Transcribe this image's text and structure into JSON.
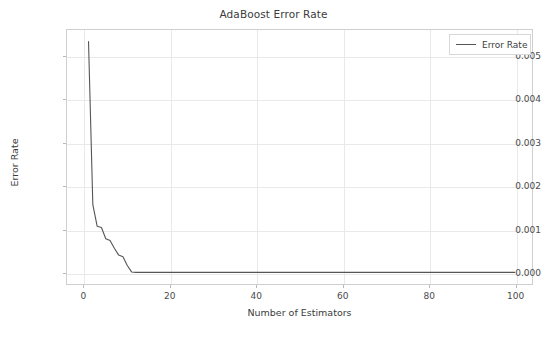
{
  "chart_data": {
    "type": "line",
    "title": "AdaBoost Error Rate",
    "xlabel": "Number of Estimators",
    "ylabel": "Error Rate",
    "xlim": [
      -4.0,
      104.0
    ],
    "ylim": [
      -0.00027,
      0.00562
    ],
    "xticks": [
      0,
      20,
      40,
      60,
      80,
      100
    ],
    "xtick_labels": [
      "0",
      "20",
      "40",
      "60",
      "80",
      "100"
    ],
    "yticks": [
      0.0,
      0.001,
      0.002,
      0.003,
      0.004,
      0.005
    ],
    "ytick_labels": [
      "0.000",
      "0.001",
      "0.002",
      "0.003",
      "0.004",
      "0.005"
    ],
    "grid": true,
    "legend_position": "upper right",
    "line_color": "#555555",
    "grid_color": "#e9e9e9",
    "frame_color": "#cfcfcf",
    "series": [
      {
        "name": "Error Rate",
        "x": [
          1,
          2,
          3,
          4,
          5,
          6,
          7,
          8,
          9,
          10,
          11,
          12,
          13,
          14,
          15,
          16,
          17,
          18,
          19,
          20,
          25,
          30,
          35,
          40,
          45,
          50,
          55,
          60,
          65,
          70,
          75,
          80,
          85,
          90,
          95,
          100
        ],
        "y": [
          0.00535,
          0.00157,
          0.00107,
          0.00104,
          0.00078,
          0.00074,
          0.00056,
          0.0004,
          0.00036,
          0.00016,
          1e-05,
          0.0,
          0.0,
          0.0,
          0.0,
          0.0,
          0.0,
          0.0,
          0.0,
          0.0,
          0.0,
          0.0,
          0.0,
          0.0,
          0.0,
          0.0,
          0.0,
          0.0,
          0.0,
          0.0,
          0.0,
          0.0,
          0.0,
          0.0,
          0.0,
          0.0
        ]
      }
    ]
  },
  "legend": {
    "entries": [
      {
        "label": "Error Rate"
      }
    ]
  }
}
